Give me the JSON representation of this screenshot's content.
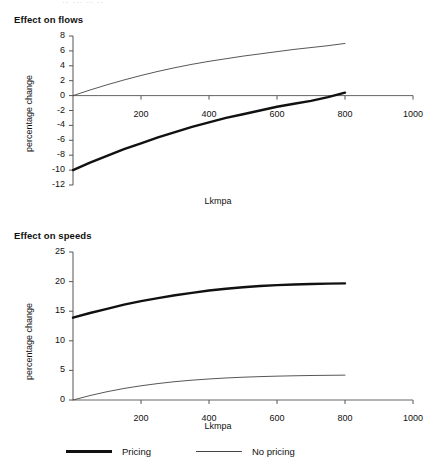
{
  "top_sliver_text": "·· ··· ·· ··",
  "legend": {
    "items": [
      {
        "label": "Pricing",
        "style": "thick",
        "color": "#111111"
      },
      {
        "label": "No pricing",
        "style": "thin",
        "color": "#444444"
      }
    ]
  },
  "chart_data": [
    {
      "type": "line",
      "title": "Effect on flows",
      "xlabel": "Lkmpa",
      "ylabel": "percentage change",
      "xlim": [
        0,
        1000
      ],
      "ylim": [
        -12,
        8
      ],
      "xticks": [
        200,
        400,
        600,
        800,
        1000
      ],
      "yticks": [
        8,
        6,
        4,
        2,
        0,
        -2,
        -4,
        -6,
        -8,
        -10,
        -12
      ],
      "xticklabels": [
        "200",
        "400",
        "600",
        "800",
        "1000"
      ],
      "yticklabels": [
        "8",
        "6",
        "4",
        "2",
        "0",
        "-2",
        "-4",
        "-6",
        "-8",
        "-10",
        "-12"
      ],
      "grid": false,
      "legend_position": "below-figure",
      "x": [
        0,
        50,
        100,
        150,
        200,
        250,
        300,
        350,
        400,
        450,
        500,
        550,
        600,
        650,
        700,
        750,
        800
      ],
      "series": [
        {
          "name": "Pricing",
          "style": "thick",
          "color": "#111111",
          "values": [
            -10.0,
            -9.0,
            -8.1,
            -7.2,
            -6.4,
            -5.6,
            -4.9,
            -4.2,
            -3.6,
            -3.0,
            -2.5,
            -2.0,
            -1.5,
            -1.1,
            -0.7,
            -0.2,
            0.4
          ]
        },
        {
          "name": "No pricing",
          "style": "thin",
          "color": "#444444",
          "values": [
            0.0,
            0.75,
            1.45,
            2.1,
            2.7,
            3.25,
            3.75,
            4.2,
            4.6,
            4.95,
            5.3,
            5.6,
            5.9,
            6.2,
            6.45,
            6.7,
            7.0
          ]
        }
      ]
    },
    {
      "type": "line",
      "title": "Effect on speeds",
      "xlabel": "Lkmpa",
      "ylabel": "percentage change",
      "xlim": [
        0,
        1000
      ],
      "ylim": [
        0,
        25
      ],
      "xticks": [
        200,
        400,
        600,
        800,
        1000
      ],
      "yticks": [
        25,
        20,
        15,
        10,
        5,
        0
      ],
      "xticklabels": [
        "200",
        "400",
        "600",
        "800",
        "1000"
      ],
      "yticklabels": [
        "25",
        "20",
        "15",
        "10",
        "5",
        "0"
      ],
      "grid": false,
      "legend_position": "below-figure",
      "x": [
        0,
        50,
        100,
        150,
        200,
        250,
        300,
        350,
        400,
        450,
        500,
        550,
        600,
        650,
        700,
        750,
        800
      ],
      "series": [
        {
          "name": "Pricing",
          "style": "thick",
          "color": "#111111",
          "values": [
            13.9,
            14.7,
            15.4,
            16.1,
            16.7,
            17.2,
            17.7,
            18.1,
            18.5,
            18.8,
            19.05,
            19.25,
            19.4,
            19.5,
            19.6,
            19.65,
            19.7
          ]
        },
        {
          "name": "No pricing",
          "style": "thin",
          "color": "#444444",
          "values": [
            0.0,
            0.75,
            1.4,
            1.95,
            2.4,
            2.78,
            3.1,
            3.35,
            3.55,
            3.72,
            3.85,
            3.95,
            4.03,
            4.09,
            4.14,
            4.17,
            4.2
          ]
        }
      ]
    }
  ]
}
